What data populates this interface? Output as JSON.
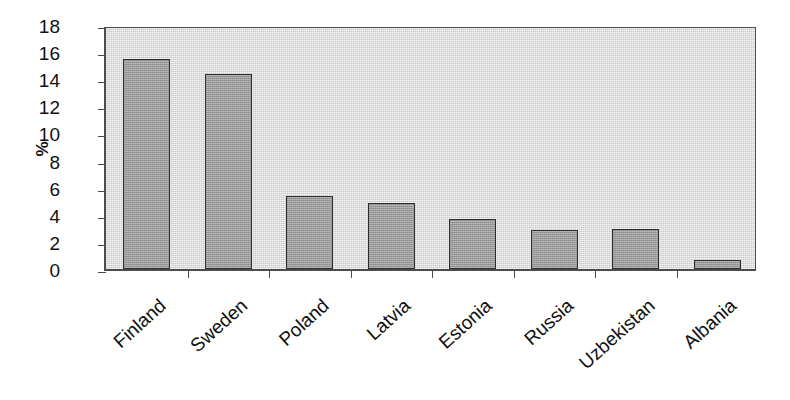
{
  "chart_data": {
    "type": "bar",
    "title": "",
    "subtitle": "",
    "xlabel": "",
    "ylabel": "%",
    "categories": [
      "Finland",
      "Sweden",
      "Poland",
      "Latvia",
      "Estonia",
      "Russia",
      "Uzbekistan",
      "Albania"
    ],
    "values": [
      15.5,
      14.4,
      5.4,
      4.9,
      3.7,
      2.9,
      2.95,
      0.7
    ],
    "series": [
      {
        "name": "",
        "values": [
          15.5,
          14.4,
          5.4,
          4.9,
          3.7,
          2.9,
          2.95,
          0.7
        ]
      }
    ],
    "ylim": [
      0,
      18
    ],
    "ytick_values": [
      0,
      2,
      4,
      6,
      8,
      10,
      12,
      14,
      16,
      18
    ],
    "ytick_labels": [
      "0",
      "2",
      "4",
      "6",
      "8",
      "10",
      "12",
      "14",
      "16",
      "18"
    ],
    "ytick_step": 2,
    "grid": false,
    "legend": null,
    "legend_position": "none",
    "annotations": [],
    "colors": {
      "bar_fill": "#9a9a9a",
      "bar_edge": "#2e2e2e",
      "plot_background": "#c9c9c9",
      "axis": "#4c4c4c",
      "text": "#111111",
      "page_background": "#ffffff"
    }
  }
}
